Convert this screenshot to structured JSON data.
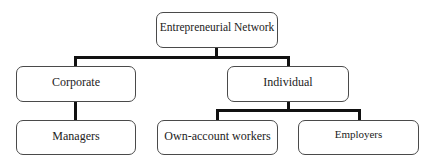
{
  "diagram": {
    "type": "hierarchy",
    "root": {
      "label": "Entrepreneurial Network"
    },
    "level1": [
      {
        "label": "Corporate"
      },
      {
        "label": "Individual"
      }
    ],
    "level2": [
      {
        "label": "Managers",
        "parent": "Corporate"
      },
      {
        "label": "Own-account workers",
        "parent": "Individual"
      },
      {
        "label": "Employers",
        "parent": "Individual"
      }
    ],
    "edges": [
      {
        "from": "Entrepreneurial Network",
        "to": "Corporate"
      },
      {
        "from": "Entrepreneurial Network",
        "to": "Individual"
      },
      {
        "from": "Corporate",
        "to": "Managers"
      },
      {
        "from": "Individual",
        "to": "Own-account workers"
      },
      {
        "from": "Individual",
        "to": "Employers"
      }
    ],
    "colors": {
      "connector": "#111111",
      "box_border": "#4a4a4a",
      "background": "#ffffff",
      "text": "#222222"
    }
  }
}
